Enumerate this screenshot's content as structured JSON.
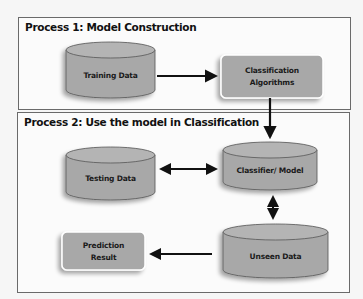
{
  "process1": {
    "title": "Process 1:  Model Construction",
    "nodes": {
      "training_data": "Training Data",
      "classification_algorithms": [
        "Classification",
        "Algorithms"
      ]
    }
  },
  "process2": {
    "title": "Process 2: Use the model in Classification",
    "nodes": {
      "testing_data": "Testing Data",
      "classifier_model": "Classifier/ Model",
      "unseen_data": "Unseen Data",
      "prediction_result": [
        "Prediction",
        "Result"
      ]
    }
  },
  "colors": {
    "node_fill": "#a8a8a8",
    "node_stroke": "#555555",
    "arrow": "#111111",
    "panel_border": "#6a6a6a"
  },
  "edges": [
    {
      "from": "Training Data",
      "to": "Classification Algorithms",
      "type": "single"
    },
    {
      "from": "Classification Algorithms",
      "to": "Classifier/ Model",
      "type": "single"
    },
    {
      "from": "Testing Data",
      "to": "Classifier/ Model",
      "type": "double"
    },
    {
      "from": "Classifier/ Model",
      "to": "Unseen Data",
      "type": "double"
    },
    {
      "from": "Unseen Data",
      "to": "Prediction Result",
      "type": "single"
    }
  ]
}
